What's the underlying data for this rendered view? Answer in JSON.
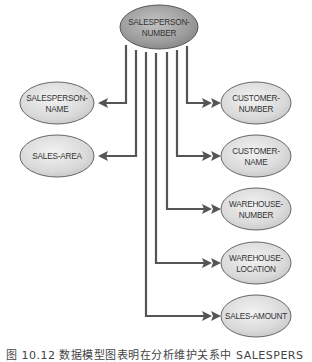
{
  "diagram": {
    "type": "data-model-dependency",
    "root": {
      "id": "salesperson-number",
      "label_lines": [
        "SALESPERSON-",
        "NUMBER"
      ]
    },
    "nodes": [
      {
        "id": "salesperson-name",
        "side": "left",
        "label_lines": [
          "SALESPERSON-",
          "NAME"
        ],
        "relationship": "one-to-one"
      },
      {
        "id": "sales-area",
        "side": "left",
        "label_lines": [
          "SALES-AREA"
        ],
        "relationship": "one-to-one"
      },
      {
        "id": "customer-number",
        "side": "right",
        "label_lines": [
          "CUSTOMER-",
          "NUMBER"
        ],
        "relationship": "one-to-many"
      },
      {
        "id": "customer-name",
        "side": "right",
        "label_lines": [
          "CUSTOMER-",
          "NAME"
        ],
        "relationship": "one-to-many"
      },
      {
        "id": "warehouse-number",
        "side": "right",
        "label_lines": [
          "WAREHOUSE-",
          "NUMBER"
        ],
        "relationship": "one-to-many"
      },
      {
        "id": "warehouse-location",
        "side": "right",
        "label_lines": [
          "WAREHOUSE-",
          "LOCATION"
        ],
        "relationship": "one-to-many"
      },
      {
        "id": "sales-amount",
        "side": "right",
        "label_lines": [
          "SALES-AMOUNT"
        ],
        "relationship": "one-to-many"
      }
    ],
    "edges": [
      {
        "from": "salesperson-number",
        "to": "salesperson-name",
        "arrow": "single"
      },
      {
        "from": "salesperson-number",
        "to": "sales-area",
        "arrow": "single"
      },
      {
        "from": "salesperson-number",
        "to": "customer-number",
        "arrow": "double"
      },
      {
        "from": "salesperson-number",
        "to": "customer-name",
        "arrow": "double"
      },
      {
        "from": "salesperson-number",
        "to": "warehouse-number",
        "arrow": "double"
      },
      {
        "from": "salesperson-number",
        "to": "warehouse-location",
        "arrow": "double"
      },
      {
        "from": "salesperson-number",
        "to": "sales-amount",
        "arrow": "double"
      }
    ],
    "colors": {
      "root_fill": "#9c9c9c",
      "node_fill": "#dcdcdc",
      "line": "#555555",
      "text": "#333333"
    }
  },
  "labels": {
    "root_l1": "SALESPERSON-",
    "root_l2": "NUMBER",
    "sp_name_l1": "SALESPERSON-",
    "sp_name_l2": "NAME",
    "sales_area": "SALES-AREA",
    "cust_num_l1": "CUSTOMER-",
    "cust_num_l2": "NUMBER",
    "cust_name_l1": "CUSTOMER-",
    "cust_name_l2": "NAME",
    "wh_num_l1": "WAREHOUSE-",
    "wh_num_l2": "NUMBER",
    "wh_loc_l1": "WAREHOUSE-",
    "wh_loc_l2": "LOCATION",
    "sales_amount": "SALES-AMOUNT"
  },
  "caption": "图 10.12  数据模型图表明在分析维护关系中 SALESPERS"
}
